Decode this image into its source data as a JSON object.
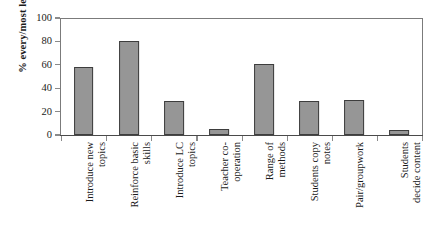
{
  "chart_data": {
    "type": "bar",
    "title": "",
    "xlabel": "",
    "ylabel": "% every/most lessons",
    "ylim": [
      0,
      100
    ],
    "ytick_values": [
      100,
      80,
      60,
      40,
      20,
      0
    ],
    "grid": false,
    "legend": false,
    "orientation": "vertical",
    "bar_color": "#969696",
    "bar_edge_color": "#3d3d3d",
    "frame_color": "#7b7b7b",
    "categories": [
      "Introduce new topics",
      "Reinforce basic skills",
      "Introduce LC topics",
      "Teacher co-operation",
      "Range of methods",
      "Students copy notes",
      "Pair/groupwork",
      "Students decide content"
    ],
    "category_lines": [
      [
        "Introduce new",
        "topics"
      ],
      [
        "Reinforce basic",
        "skills"
      ],
      [
        "Introduce LC",
        "topics"
      ],
      [
        "Teacher co-",
        "operation"
      ],
      [
        "Range of",
        "methods"
      ],
      [
        "Students copy",
        "notes"
      ],
      [
        "Pair/groupwork",
        ""
      ],
      [
        "Students",
        "decide content"
      ]
    ],
    "values": [
      58,
      80,
      29,
      5,
      61,
      29,
      30,
      4
    ]
  }
}
